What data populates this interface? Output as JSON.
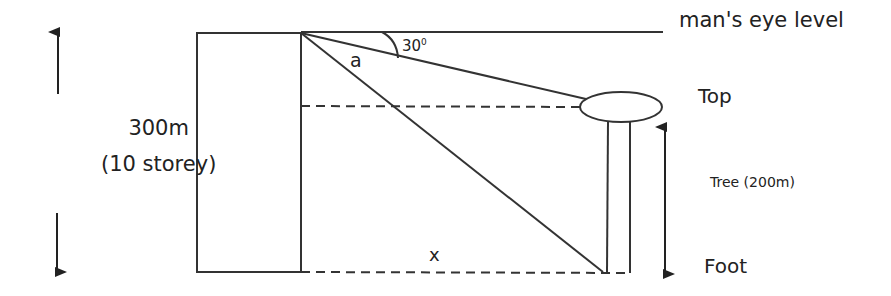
{
  "diagram": {
    "type": "angle-of-depression problem",
    "labels": {
      "eye_level": "man's eye level",
      "top": "Top",
      "foot": "Foot",
      "tree": "Tree (200m)",
      "building_height": "300m",
      "building_storeys": "(10 storey)",
      "diagonal": "a",
      "distance": "x",
      "angle_value": "30",
      "angle_unit": "0"
    },
    "colors": {
      "stroke": "#222222",
      "background": "#ffffff"
    }
  }
}
